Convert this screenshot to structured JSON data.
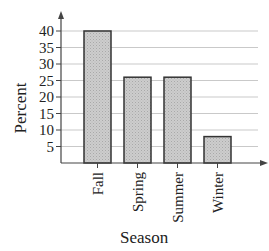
{
  "chart_data": {
    "type": "bar",
    "title": "",
    "xlabel": "Season",
    "ylabel": "Percent",
    "categories": [
      "Fall",
      "Spring",
      "Summer",
      "Winter"
    ],
    "values": [
      40,
      26,
      26,
      8
    ],
    "ylim": [
      0,
      42
    ],
    "yticks": [
      5,
      10,
      15,
      20,
      25,
      30,
      35,
      40
    ],
    "grid": true,
    "legend": null,
    "bar_color": "#c8c8c8",
    "bar_edge_color": "#333333"
  }
}
